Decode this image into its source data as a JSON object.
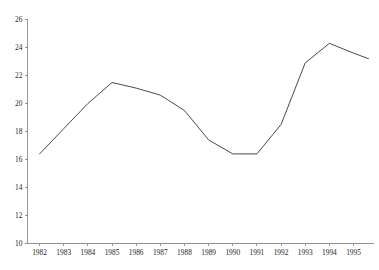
{
  "chart_data": {
    "type": "line",
    "title": "",
    "xlabel": "",
    "ylabel": "",
    "categories": [
      "1982",
      "1983",
      "1984",
      "1985",
      "1986",
      "1987",
      "1988",
      "1989",
      "1990",
      "1991",
      "1992",
      "1993",
      "1994",
      "1995"
    ],
    "values": [
      16.4,
      18.2,
      20.0,
      21.5,
      21.1,
      20.6,
      19.5,
      17.4,
      16.4,
      16.4,
      18.5,
      22.9,
      24.3,
      23.6
    ],
    "series": [
      {
        "name": "series-1",
        "values": [
          16.4,
          18.2,
          20.0,
          21.5,
          21.1,
          20.6,
          19.5,
          17.4,
          16.4,
          16.4,
          18.5,
          22.9,
          24.3,
          23.6
        ],
        "color": "#4a4a4a",
        "trailing_point": 23.2
      }
    ],
    "ylim": [
      10,
      26
    ],
    "xlim": [
      "1982",
      "1995"
    ],
    "y_ticks": [
      10,
      12,
      14,
      16,
      18,
      20,
      22,
      24,
      26
    ],
    "y_tick_labels": [
      "10",
      "12",
      "14",
      "16",
      "18",
      "20",
      "22",
      "24",
      "26"
    ],
    "x_ticks": [
      "1982",
      "1983",
      "1984",
      "1985",
      "1986",
      "1987",
      "1988",
      "1989",
      "1990",
      "1991",
      "1992",
      "1993",
      "1994",
      "1995"
    ],
    "x_tick_labels": [
      "1982",
      "1983",
      "1984",
      "1985",
      "1986",
      "1987",
      "1988",
      "1989",
      "1990",
      "1991",
      "1992",
      "1993",
      "1994",
      "1995"
    ],
    "grid": false,
    "legend": false,
    "legend_position": "none",
    "annotations": [],
    "line_color": "#4a4a4a",
    "axis_color": "#8a8a8a",
    "background_color": "#ffffff"
  },
  "axes": {
    "y_axis_name": "value-axis",
    "x_axis_name": "year-axis"
  }
}
